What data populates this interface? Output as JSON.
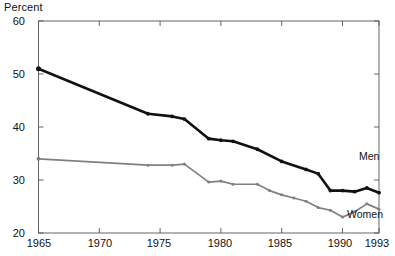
{
  "chart_data": {
    "type": "line",
    "title": "",
    "subtitle": "",
    "ylabel": "Percent",
    "xlabel": "",
    "ylim": [
      20,
      60
    ],
    "xlim": [
      1964,
      1993.5
    ],
    "yticks": [
      20,
      30,
      40,
      50,
      60
    ],
    "xticks": [
      1965,
      1970,
      1975,
      1980,
      1985,
      1990,
      1993
    ],
    "grid": false,
    "legend_position": "inline-right",
    "annotations": [
      "Men",
      "Women"
    ],
    "series": [
      {
        "name": "Men",
        "color": "#111111",
        "x": [
          1965,
          1974,
          1976,
          1977,
          1979,
          1980,
          1981,
          1983,
          1985,
          1987,
          1988,
          1989,
          1990,
          1991,
          1992,
          1993
        ],
        "values": [
          51.0,
          42.5,
          42.0,
          41.5,
          37.8,
          37.5,
          37.3,
          35.8,
          33.5,
          32.0,
          31.2,
          28.0,
          28.0,
          27.8,
          28.5,
          27.6
        ]
      },
      {
        "name": "Women",
        "color": "#808080",
        "x": [
          1965,
          1974,
          1976,
          1977,
          1979,
          1980,
          1981,
          1983,
          1984,
          1985,
          1986,
          1987,
          1988,
          1989,
          1990,
          1991,
          1992,
          1993
        ],
        "values": [
          34.0,
          32.8,
          32.8,
          33.0,
          29.6,
          29.8,
          29.2,
          29.2,
          28.0,
          27.2,
          26.6,
          26.0,
          24.8,
          24.3,
          23.0,
          24.0,
          25.5,
          24.5
        ]
      }
    ]
  },
  "axis": {
    "ylabel_text": "Percent",
    "ytick_labels": [
      "60",
      "50",
      "40",
      "30",
      "20"
    ],
    "xtick_labels": [
      "1965",
      "1970",
      "1975",
      "1980",
      "1985",
      "1990",
      "1993"
    ]
  },
  "labels": {
    "men": "Men",
    "women": "Women"
  },
  "colors": {
    "men_line": "#111111",
    "women_line": "#808080",
    "axis": "#555555",
    "text": "#111111",
    "background": "#ffffff"
  }
}
